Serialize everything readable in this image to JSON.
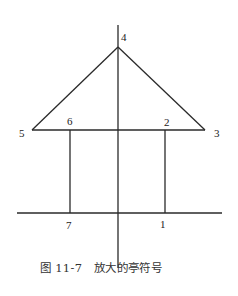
{
  "diagram": {
    "title": "放大的亭符号",
    "caption_number": "图 11-7",
    "caption_text": "放大的亭符号",
    "points": [
      {
        "id": "1",
        "label": "1",
        "x": 165,
        "y": 213
      },
      {
        "id": "2",
        "label": "2",
        "x": 165,
        "y": 130
      },
      {
        "id": "3",
        "label": "3",
        "x": 205,
        "y": 130
      },
      {
        "id": "4",
        "label": "4",
        "x": 118,
        "y": 47
      },
      {
        "id": "5",
        "label": "5",
        "x": 32,
        "y": 130
      },
      {
        "id": "6",
        "label": "6",
        "x": 70,
        "y": 130
      },
      {
        "id": "7",
        "label": "7",
        "x": 70,
        "y": 213
      }
    ],
    "line_color": "#2a2a2a"
  }
}
